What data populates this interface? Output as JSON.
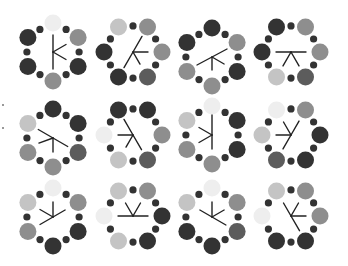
{
  "figure": {
    "width": 348,
    "height": 266,
    "background": "#ffffff",
    "ring": {
      "big_radius_offset": 29,
      "big_r": 8.5,
      "small_r": 3.6,
      "small_color": "#333333"
    },
    "glyph_color": "#222222",
    "palette": {
      "very_light": "#eeeeee",
      "light": "#c4c4c4",
      "medium": "#8e8e8e",
      "medium_dark": "#5c5c5c",
      "dark": "#333333"
    },
    "edge_marks": [
      {
        "y": 104
      },
      {
        "y": 127
      }
    ],
    "cells": [
      {
        "row": 0,
        "col": 0,
        "cx": 53,
        "cy": 52,
        "orientation": "pointy",
        "big": [
          "very_light",
          "medium",
          "dark",
          "medium",
          "dark",
          "dark"
        ],
        "glyph": [
          {
            "angle": 90,
            "len": 17
          },
          {
            "angle": 270,
            "len": 17
          },
          {
            "angle": 30,
            "len": 15
          },
          {
            "angle": -30,
            "len": 15
          }
        ]
      },
      {
        "row": 0,
        "col": 1,
        "cx": 133,
        "cy": 52,
        "orientation": "flat",
        "big": [
          "light",
          "medium",
          "medium",
          "medium_dark",
          "dark",
          "dark"
        ],
        "glyph": [
          {
            "angle": 60,
            "len": 18
          },
          {
            "angle": 240,
            "len": 18
          },
          {
            "angle": 0,
            "len": 15
          },
          {
            "angle": -60,
            "len": 14
          }
        ]
      },
      {
        "row": 0,
        "col": 2,
        "cx": 212,
        "cy": 57,
        "orientation": "pointy",
        "big": [
          "dark",
          "medium",
          "dark",
          "medium",
          "medium",
          "dark"
        ],
        "glyph": [
          {
            "angle": 28,
            "len": 17
          },
          {
            "angle": 208,
            "len": 17
          },
          {
            "angle": -90,
            "len": 13
          },
          {
            "angle": -30,
            "len": 14
          }
        ]
      },
      {
        "row": 0,
        "col": 3,
        "cx": 291,
        "cy": 52,
        "orientation": "flat",
        "big": [
          "dark",
          "medium",
          "medium",
          "medium_dark",
          "light",
          "dark"
        ],
        "glyph": [
          {
            "angle": 0,
            "len": 15
          },
          {
            "angle": 180,
            "len": 15
          },
          {
            "angle": -120,
            "len": 16
          },
          {
            "angle": -60,
            "len": 16
          }
        ]
      },
      {
        "row": 1,
        "col": 0,
        "cx": 53,
        "cy": 138,
        "orientation": "pointy",
        "big": [
          "dark",
          "dark",
          "medium_dark",
          "medium",
          "medium",
          "light"
        ],
        "glyph": [
          {
            "angle": 150,
            "len": 17
          },
          {
            "angle": -30,
            "len": 17
          },
          {
            "angle": -90,
            "len": 14
          },
          {
            "angle": 200,
            "len": 15
          }
        ]
      },
      {
        "row": 1,
        "col": 1,
        "cx": 133,
        "cy": 135,
        "orientation": "flat",
        "big": [
          "dark",
          "dark",
          "medium",
          "medium_dark",
          "light",
          "very_light"
        ],
        "glyph": [
          {
            "angle": 120,
            "len": 18
          },
          {
            "angle": 180,
            "len": 15
          },
          {
            "angle": -60,
            "len": 17
          },
          {
            "angle": 240,
            "len": 14
          }
        ]
      },
      {
        "row": 1,
        "col": 2,
        "cx": 212,
        "cy": 135,
        "orientation": "pointy",
        "big": [
          "very_light",
          "dark",
          "dark",
          "medium",
          "medium",
          "light"
        ],
        "glyph": [
          {
            "angle": 90,
            "len": 20
          },
          {
            "angle": 270,
            "len": 14
          },
          {
            "angle": 150,
            "len": 15
          },
          {
            "angle": 210,
            "len": 15
          }
        ]
      },
      {
        "row": 1,
        "col": 3,
        "cx": 291,
        "cy": 135,
        "orientation": "flat",
        "big": [
          "very_light",
          "medium",
          "dark",
          "dark",
          "medium_dark",
          "light"
        ],
        "glyph": [
          {
            "angle": 60,
            "len": 16
          },
          {
            "angle": 120,
            "len": 15
          },
          {
            "angle": 180,
            "len": 15
          },
          {
            "angle": 240,
            "len": 16
          }
        ]
      },
      {
        "row": 2,
        "col": 0,
        "cx": 53,
        "cy": 217,
        "orientation": "pointy",
        "big": [
          "very_light",
          "medium",
          "dark",
          "dark",
          "medium",
          "light"
        ],
        "glyph": [
          {
            "angle": 90,
            "len": 15
          },
          {
            "angle": 150,
            "len": 15
          },
          {
            "angle": 30,
            "len": 14
          },
          {
            "angle": 210,
            "len": 15
          }
        ]
      },
      {
        "row": 2,
        "col": 1,
        "cx": 133,
        "cy": 216,
        "orientation": "flat",
        "big": [
          "light",
          "medium",
          "dark",
          "dark",
          "light",
          "very_light"
        ],
        "glyph": [
          {
            "angle": 0,
            "len": 15
          },
          {
            "angle": 180,
            "len": 15
          },
          {
            "angle": 60,
            "len": 15
          },
          {
            "angle": 120,
            "len": 15
          }
        ]
      },
      {
        "row": 2,
        "col": 2,
        "cx": 212,
        "cy": 217,
        "orientation": "pointy",
        "big": [
          "very_light",
          "medium",
          "medium_dark",
          "dark",
          "dark",
          "light"
        ],
        "glyph": [
          {
            "angle": 90,
            "len": 15
          },
          {
            "angle": 150,
            "len": 14
          },
          {
            "angle": 30,
            "len": 14
          },
          {
            "angle": -30,
            "len": 16
          }
        ]
      },
      {
        "row": 2,
        "col": 3,
        "cx": 291,
        "cy": 216,
        "orientation": "flat",
        "big": [
          "light",
          "medium",
          "medium",
          "dark",
          "dark",
          "very_light"
        ],
        "glyph": [
          {
            "angle": 120,
            "len": 15
          },
          {
            "angle": 60,
            "len": 15
          },
          {
            "angle": 0,
            "len": 15
          },
          {
            "angle": -60,
            "len": 17
          }
        ]
      }
    ]
  }
}
